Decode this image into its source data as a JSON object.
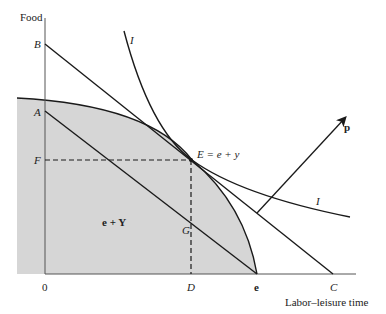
{
  "diagram": {
    "type": "production-possibility / indifference diagram",
    "axes": {
      "y_label": "Food",
      "x_label": "Labor–leisure time",
      "origin_label": "0"
    },
    "points": {
      "A": "A",
      "B": "B",
      "C": "C",
      "D": "D",
      "F": "F",
      "G": "G",
      "e": "e",
      "E": "E = e + y"
    },
    "regions": {
      "production_set": "e + Y"
    },
    "curves": {
      "indifference_top": "I",
      "indifference_right": "I"
    },
    "vectors": {
      "price": "p"
    },
    "colors": {
      "shade": "#d6d6d6",
      "line": "#1a1a1a",
      "axis": "#555555"
    }
  }
}
